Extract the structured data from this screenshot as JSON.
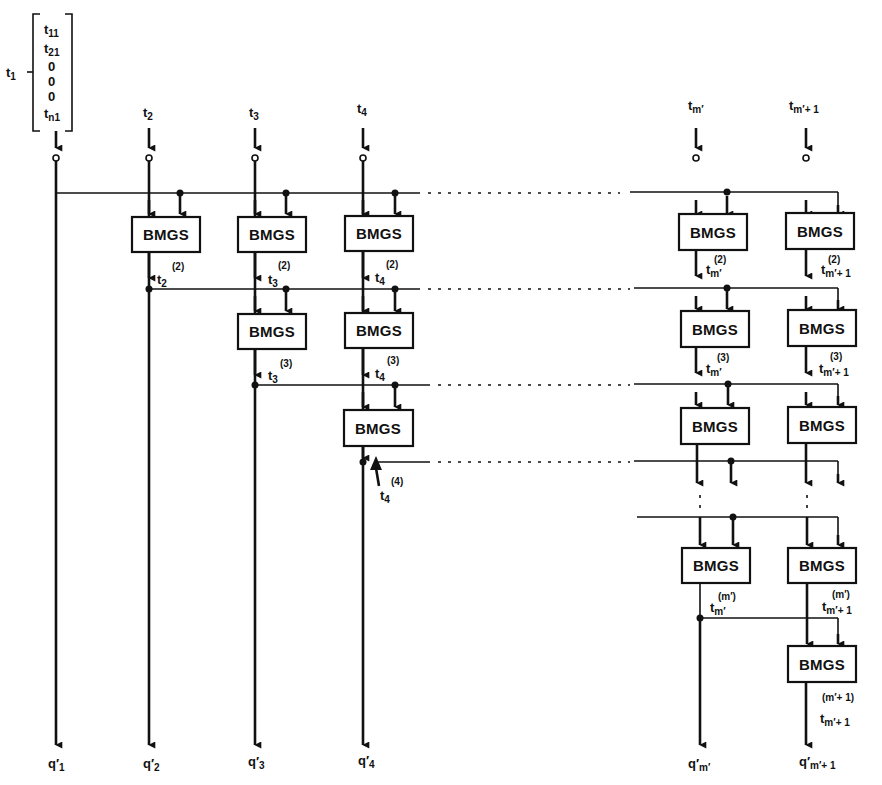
{
  "diagram": {
    "block_label": "BMGS",
    "vector_t1": {
      "name": "t",
      "name_sub": "1",
      "entries": [
        {
          "base": "t",
          "sub": "11"
        },
        {
          "base": "t",
          "sub": "21"
        },
        {
          "base": "0",
          "sub": ""
        },
        {
          "base": "0",
          "sub": ""
        },
        {
          "base": "0",
          "sub": ""
        },
        {
          "base": "t",
          "sub": "n1"
        }
      ]
    },
    "inputs": [
      {
        "base": "t",
        "sub": "2"
      },
      {
        "base": "t",
        "sub": "3"
      },
      {
        "base": "t",
        "sub": "4"
      },
      {
        "base": "t",
        "sub": "m′"
      },
      {
        "base": "t",
        "sub": "m′+ 1"
      }
    ],
    "intermediate_labels": [
      {
        "base": "t",
        "sub": "2",
        "sup": "(2)"
      },
      {
        "base": "t",
        "sub": "3",
        "sup": "(2)"
      },
      {
        "base": "t",
        "sub": "4",
        "sup": "(2)"
      },
      {
        "base": "t",
        "sub": "m′",
        "sup": "(2)"
      },
      {
        "base": "t",
        "sub": "m′+ 1",
        "sup": "(2)"
      },
      {
        "base": "t",
        "sub": "3",
        "sup": "(3)"
      },
      {
        "base": "t",
        "sub": "4",
        "sup": "(3)"
      },
      {
        "base": "t",
        "sub": "m′",
        "sup": "(3)"
      },
      {
        "base": "t",
        "sub": "m′+ 1",
        "sup": "(3)"
      },
      {
        "base": "t",
        "sub": "4",
        "sup": "(4)"
      },
      {
        "base": "t",
        "sub": "m′",
        "sup": "(m′)"
      },
      {
        "base": "t",
        "sub": "m′+ 1",
        "sup": "(m′)"
      },
      {
        "base": "t",
        "sub": "m′+ 1",
        "sup": "(m′+ 1)"
      }
    ],
    "outputs": [
      {
        "base": "q′",
        "sub": "1"
      },
      {
        "base": "q′",
        "sub": "2"
      },
      {
        "base": "q′",
        "sub": "3"
      },
      {
        "base": "q′",
        "sub": "4"
      },
      {
        "base": "q′",
        "sub": "m′"
      },
      {
        "base": "q′",
        "sub": "m′+ 1"
      }
    ]
  }
}
